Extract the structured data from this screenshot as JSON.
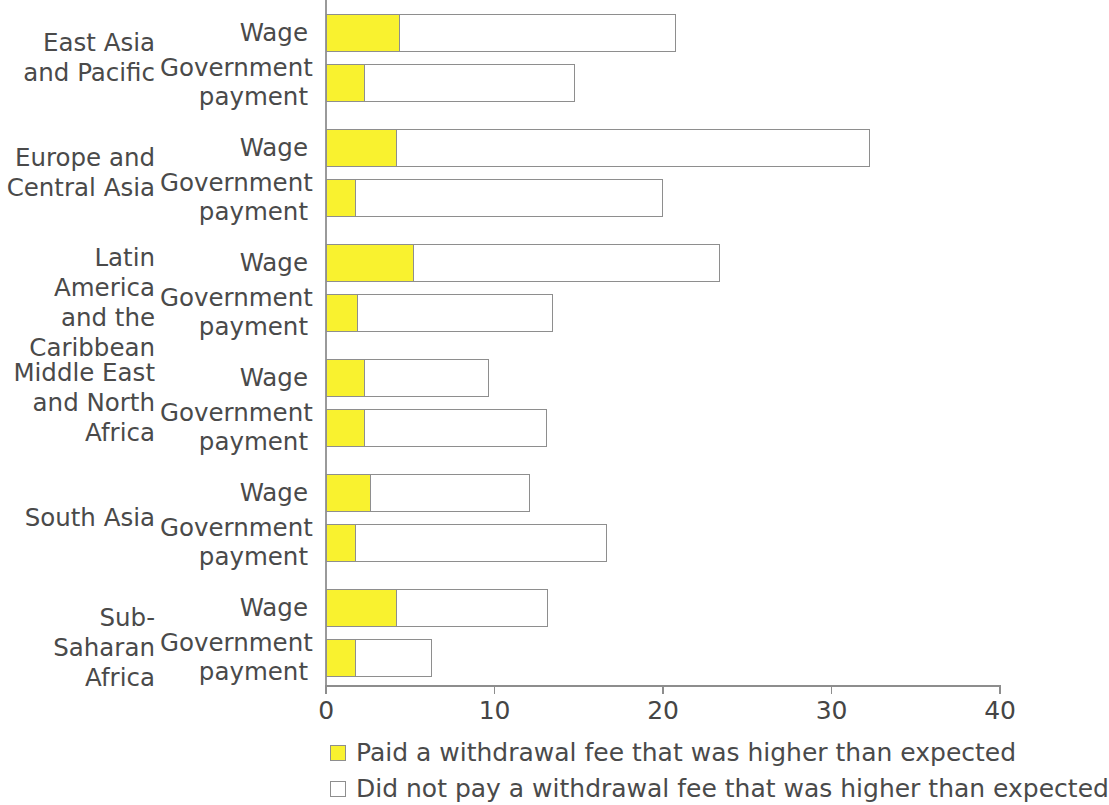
{
  "chart_data": {
    "type": "bar",
    "orientation": "horizontal",
    "stacked": true,
    "title": "",
    "subtitle": "",
    "xlabel": "",
    "ylabel": "",
    "xlim": [
      0,
      40
    ],
    "xticks": [
      0,
      10,
      20,
      30,
      40
    ],
    "xtick_labels": [
      "0",
      "10",
      "20",
      "30",
      "40"
    ],
    "grid": false,
    "legend_position": "bottom",
    "legend": [
      {
        "key": "paid",
        "label": "Paid a withdrawal fee that was higher than expected",
        "color": "#f9f22f"
      },
      {
        "key": "not_paid",
        "label": "Did not pay a withdrawal fee that was higher than expected",
        "color": "#ffffff"
      }
    ],
    "series": [
      {
        "name": "Paid a withdrawal fee that was higher than expected",
        "key": "paid",
        "color": "#f9f22f"
      },
      {
        "name": "Did not pay a withdrawal fee that was higher than expected",
        "key": "not_paid",
        "color": "#ffffff"
      }
    ],
    "groups": [
      {
        "region": "East Asia\nand Pacific",
        "region_lines": [
          "East Asia",
          "and Pacific"
        ],
        "rows": [
          {
            "label": "Wage",
            "label_lines": [
              "Wage"
            ],
            "paid": 4.4,
            "not_paid": 16.4,
            "total": 20.8
          },
          {
            "label": "Government payment",
            "label_lines": [
              "Government",
              "payment"
            ],
            "paid": 2.3,
            "not_paid": 12.5,
            "total": 14.8
          }
        ]
      },
      {
        "region": "Europe and\nCentral Asia",
        "region_lines": [
          "Europe and",
          "Central Asia"
        ],
        "rows": [
          {
            "label": "Wage",
            "label_lines": [
              "Wage"
            ],
            "paid": 4.2,
            "not_paid": 28.1,
            "total": 32.3
          },
          {
            "label": "Government payment",
            "label_lines": [
              "Government",
              "payment"
            ],
            "paid": 1.8,
            "not_paid": 18.2,
            "total": 20.0
          }
        ]
      },
      {
        "region": "Latin America\nand the\nCaribbean",
        "region_lines": [
          "Latin America",
          "and the",
          "Caribbean"
        ],
        "rows": [
          {
            "label": "Wage",
            "label_lines": [
              "Wage"
            ],
            "paid": 5.2,
            "not_paid": 18.2,
            "total": 23.4
          },
          {
            "label": "Government payment",
            "label_lines": [
              "Government",
              "payment"
            ],
            "paid": 1.9,
            "not_paid": 11.6,
            "total": 13.5
          }
        ]
      },
      {
        "region": "Middle East\nand North\nAfrica",
        "region_lines": [
          "Middle East",
          "and North",
          "Africa"
        ],
        "rows": [
          {
            "label": "Wage",
            "label_lines": [
              "Wage"
            ],
            "paid": 2.3,
            "not_paid": 7.4,
            "total": 9.7
          },
          {
            "label": "Government payment",
            "label_lines": [
              "Government",
              "payment"
            ],
            "paid": 2.3,
            "not_paid": 10.8,
            "total": 13.1
          }
        ]
      },
      {
        "region": "South Asia",
        "region_lines": [
          "South Asia"
        ],
        "rows": [
          {
            "label": "Wage",
            "label_lines": [
              "Wage"
            ],
            "paid": 2.7,
            "not_paid": 9.4,
            "total": 12.1
          },
          {
            "label": "Government payment",
            "label_lines": [
              "Government",
              "payment"
            ],
            "paid": 1.8,
            "not_paid": 14.9,
            "total": 16.7
          }
        ]
      },
      {
        "region": "Sub-Saharan\nAfrica",
        "region_lines": [
          "Sub-Saharan",
          "Africa"
        ],
        "rows": [
          {
            "label": "Wage",
            "label_lines": [
              "Wage"
            ],
            "paid": 4.2,
            "not_paid": 9.0,
            "total": 13.2
          },
          {
            "label": "Government payment",
            "label_lines": [
              "Government",
              "payment"
            ],
            "paid": 1.8,
            "not_paid": 4.5,
            "total": 6.3
          }
        ]
      }
    ]
  },
  "colors": {
    "paid": "#f9f22f",
    "not_paid": "#ffffff",
    "axis": "#8d8d8d",
    "text": "#4a4a4a",
    "bar_border": "#8e8e8e"
  }
}
